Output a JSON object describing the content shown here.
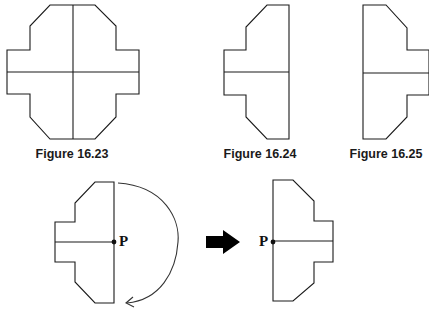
{
  "figures": [
    {
      "id": "fig-16-23",
      "caption": "Figure 16.23",
      "description": "Full symmetric shape with vertical and horizontal lines of symmetry"
    },
    {
      "id": "fig-16-24",
      "caption": "Figure 16.24",
      "description": "Left half of shape"
    },
    {
      "id": "fig-16-25",
      "caption": "Figure 16.25",
      "description": "Right half of shape (mirror image)"
    }
  ],
  "rotation_demo": {
    "point_label": "P",
    "before": "Half-shape with point P on right edge midpoint and curved rotation arrow",
    "transition": "right-arrow",
    "after": "Half-shape rotated 180 degrees about P, P on left edge midpoint"
  },
  "colors": {
    "stroke": "#1a1a1a",
    "background": "#ffffff",
    "arrow_fill": "#000000"
  }
}
